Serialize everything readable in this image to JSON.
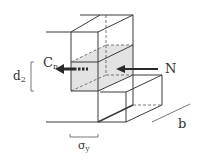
{
  "diagram": {
    "labels": {
      "compression": "C",
      "compression_sub": "n",
      "normal_force": "N",
      "depth": "d",
      "depth_sub": "2",
      "width": "b",
      "stress": "σ",
      "stress_sub": "y"
    },
    "colors": {
      "line": "#3a3a3a",
      "shade": "#e3e3e3",
      "arrow": "#2a2a2a"
    }
  }
}
